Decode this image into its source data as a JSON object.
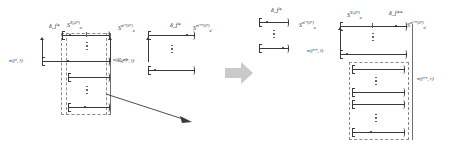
{
  "figure": {
    "type": "math-diagram",
    "title": "",
    "transition_icon": "right-arrow-icon",
    "panels": [
      {
        "id": "left-panel",
        "name": "before-refinement",
        "labels": {
          "delta_top": "δᶠ*",
          "delta_top_plain": "δ_f*",
          "s_top": "S",
          "s_top_sub": "α",
          "s_top_sup": "N₀(δ*)",
          "s_right_group": "S",
          "s_right_group_sub": "α",
          "s_right_group_sup": "nƒ*(δ*)",
          "measure_left": "n(f*, l)",
          "measure_right": "n(f*, r)"
        },
        "intervals": [
          {
            "name": "interval-top",
            "dot": "left"
          },
          {
            "name": "interval-second",
            "dot": "mid"
          },
          {
            "name": "interval-third",
            "dot": "none"
          },
          {
            "name": "interval-bottom",
            "dot": "mid"
          }
        ],
        "ellipses": 2,
        "dashed_box": true
      },
      {
        "id": "right-panel",
        "name": "after-refinement",
        "labels": {
          "delta_small": "δᶠ*",
          "delta_small_plain": "δ_f*",
          "s_left": "S",
          "s_left_sub": "α",
          "s_left_sup": "nƒ*(δ*)",
          "s_top": "S",
          "s_top_sub": "α",
          "s_top_sup": "N₁(δ*)",
          "delta_top": "δᶠ**",
          "delta_top_plain": "δ_f**",
          "s_right": "S",
          "s_right_sub": "α'",
          "s_right_sup": "nƒ**(δ*)",
          "measure_left": "n(f**, l)",
          "measure_right": "n(f**, r)"
        },
        "side_group": {
          "name": "delta-f-star-group",
          "intervals": 2,
          "ellipses": 1
        },
        "intervals": [
          {
            "name": "interval-top",
            "dot": "mid"
          },
          {
            "name": "interval-second",
            "dot": "left"
          },
          {
            "name": "interval-third",
            "dot": "none"
          },
          {
            "name": "interval-fourth",
            "dot": "none"
          },
          {
            "name": "interval-fifth",
            "dot": "none"
          },
          {
            "name": "interval-bottom",
            "dot": "mid"
          }
        ],
        "ellipses": 3,
        "dashed_box": true
      }
    ],
    "colors": {
      "ink": "#262626",
      "rule": "#3a3a3a",
      "dashed": "#8a8a8a",
      "arrow_grey": "#c9c9c9",
      "background": "#ffffff"
    }
  }
}
